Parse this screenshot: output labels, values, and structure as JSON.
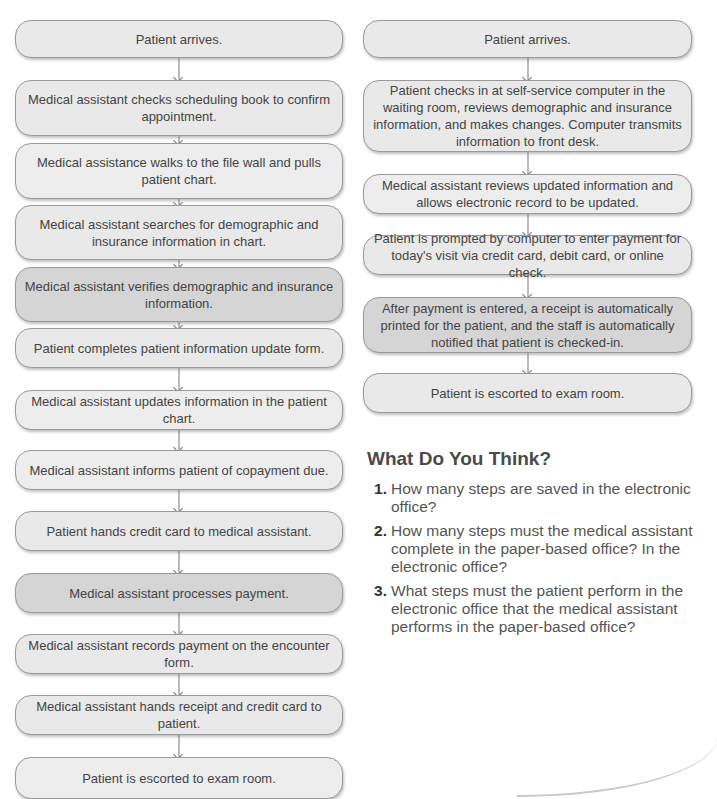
{
  "paper_office": {
    "steps": [
      {
        "text": "Patient arrives.",
        "shade": "normal"
      },
      {
        "text": "Medical assistant checks scheduling book to confirm appointment.",
        "shade": "normal"
      },
      {
        "text": "Medical assistance walks to the file wall and pulls patient chart.",
        "shade": "light"
      },
      {
        "text": "Medical assistant searches for demographic and insurance information in chart.",
        "shade": "normal"
      },
      {
        "text": "Medical assistant verifies demographic and insurance information.",
        "shade": "dark"
      },
      {
        "text": "Patient completes patient information update form.",
        "shade": "normal"
      },
      {
        "text": "Medical assistant updates information in the patient chart.",
        "shade": "light"
      },
      {
        "text": "Medical assistant informs patient of copayment due.",
        "shade": "light"
      },
      {
        "text": "Patient hands credit card to medical assistant.",
        "shade": "normal"
      },
      {
        "text": "Medical assistant processes payment.",
        "shade": "dark"
      },
      {
        "text": "Medical assistant records payment on the encounter form.",
        "shade": "normal"
      },
      {
        "text": "Medical assistant hands receipt and credit card to patient.",
        "shade": "normal"
      },
      {
        "text": "Patient is escorted to exam room.",
        "shade": "light"
      }
    ]
  },
  "electronic_office": {
    "steps": [
      {
        "text": "Patient arrives.",
        "shade": "normal"
      },
      {
        "text": "Patient checks in at self-service computer in the waiting room, reviews demographic and insurance information, and makes changes. Computer transmits information to front desk.",
        "shade": "normal"
      },
      {
        "text": "Medical assistant reviews updated information and allows electronic record to be updated.",
        "shade": "light"
      },
      {
        "text": "Patient is prompted by computer to enter payment for today's visit via credit card, debit card, or online check.",
        "shade": "normal"
      },
      {
        "text": "After payment is entered, a receipt is automatically printed for the patient, and the staff is automatically notified that patient is checked-in.",
        "shade": "dark"
      },
      {
        "text": "Patient is escorted to exam room.",
        "shade": "normal"
      }
    ]
  },
  "questions": {
    "heading": "What Do You Think?",
    "items": [
      {
        "num": "1.",
        "text": "How many steps are saved in the electronic office?"
      },
      {
        "num": "2.",
        "text": "How many steps must the medical assistant complete in the paper-based office? In the electronic office?"
      },
      {
        "num": "3.",
        "text": "What steps must the patient perform in the electronic office that the medical assistant performs in the paper-based office?"
      }
    ]
  }
}
